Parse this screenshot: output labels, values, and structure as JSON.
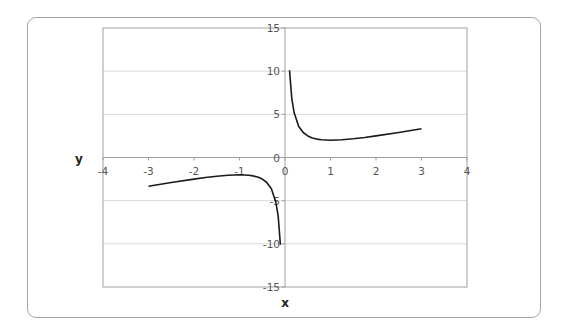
{
  "chart_data": {
    "type": "line",
    "title": "",
    "xlabel": "x",
    "ylabel": "y",
    "xlim": [
      -4,
      4
    ],
    "ylim": [
      -15,
      15
    ],
    "x_ticks": [
      -4,
      -3,
      -2,
      -1,
      0,
      1,
      2,
      3,
      4
    ],
    "y_ticks": [
      -15,
      -10,
      -5,
      0,
      5,
      10,
      15
    ],
    "x_tick_labels": [
      "-4",
      "-3",
      "-2",
      "-1",
      "0",
      "1",
      "2",
      "3",
      "4"
    ],
    "y_tick_labels": [
      "-15",
      "-10",
      "-5",
      "0",
      "5",
      "10",
      "15"
    ],
    "grid": "horizontal",
    "legend": "none",
    "line_color": "#1a1a1a",
    "grid_color": "#d9d9d9",
    "series": [
      {
        "name": "y = x + 1/x (x > 0)",
        "x": [
          0.1,
          0.15,
          0.2,
          0.3,
          0.4,
          0.5,
          0.6,
          0.7,
          0.8,
          1.0,
          1.25,
          1.5,
          1.75,
          2.0,
          2.5,
          3.0
        ],
        "y": [
          10.1,
          6.82,
          5.2,
          3.63,
          2.9,
          2.5,
          2.27,
          2.13,
          2.05,
          2.0,
          2.05,
          2.17,
          2.32,
          2.5,
          2.9,
          3.33
        ]
      },
      {
        "name": "y = x + 1/x (x < 0)",
        "x": [
          -3.0,
          -2.5,
          -2.0,
          -1.75,
          -1.5,
          -1.25,
          -1.0,
          -0.8,
          -0.7,
          -0.6,
          -0.5,
          -0.4,
          -0.3,
          -0.2,
          -0.15,
          -0.1
        ],
        "y": [
          -3.33,
          -2.9,
          -2.5,
          -2.32,
          -2.17,
          -2.05,
          -2.0,
          -2.05,
          -2.13,
          -2.27,
          -2.5,
          -2.9,
          -3.63,
          -5.2,
          -6.82,
          -10.1
        ]
      }
    ]
  }
}
